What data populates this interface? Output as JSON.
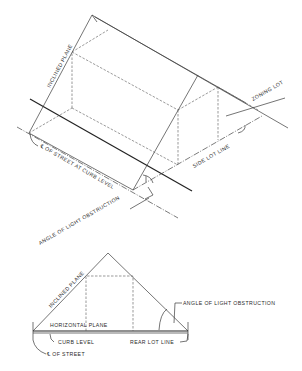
{
  "top_diagram": {
    "labels": {
      "inclined_plane": "INCLINED PLANE",
      "zoning_lot": "ZONING LOT",
      "side_lot_line": "SIDE LOT LINE",
      "street_centerline": "℄ OF STREET AT CURB LEVEL",
      "angle_of_light_obstruction": "ANGLE OF LIGHT OBSTRUCTION"
    }
  },
  "bottom_diagram": {
    "labels": {
      "inclined_plane": "INCLINED PLANE",
      "horizontal_plane": "HORIZONTAL PLANE",
      "curb_level": "CURB LEVEL",
      "street_centerline": "℄ OF STREET",
      "rear_lot_line": "REAR LOT LINE",
      "angle_of_light_obstruction": "ANGLE OF LIGHT OBSTRUCTION"
    }
  },
  "colors": {
    "background": "#ffffff",
    "ink": "#2a2a2a"
  }
}
